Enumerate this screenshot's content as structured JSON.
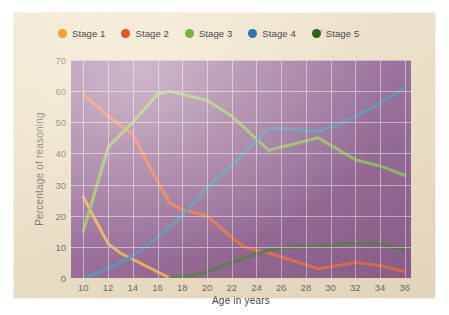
{
  "figure": {
    "paper_color": "#e9dcc2",
    "plot_background": "#7a3f8a",
    "grid_color": "#cbb8d8"
  },
  "legend": {
    "position": "top",
    "items": [
      {
        "label": "Stage 1",
        "color": "#efa52a",
        "icon": "legend-dot-icon"
      },
      {
        "label": "Stage 2",
        "color": "#e8511f",
        "icon": "legend-dot-icon"
      },
      {
        "label": "Stage 3",
        "color": "#7cb338",
        "icon": "legend-dot-icon"
      },
      {
        "label": "Stage 4",
        "color": "#2a77b5",
        "icon": "legend-dot-icon"
      },
      {
        "label": "Stage 5",
        "color": "#2f6326",
        "icon": "legend-dot-icon"
      }
    ]
  },
  "chart_data": {
    "type": "line",
    "title": "",
    "xlabel": "Age in years",
    "ylabel": "Percentage of reasoning",
    "xlim": [
      9,
      36.5
    ],
    "ylim": [
      0,
      70
    ],
    "xticks": [
      10,
      12,
      14,
      16,
      18,
      20,
      22,
      24,
      26,
      28,
      30,
      32,
      34,
      36
    ],
    "yticks": [
      0,
      10,
      20,
      30,
      40,
      50,
      60,
      70
    ],
    "grid": true,
    "legend_position": "top",
    "series": [
      {
        "name": "Stage 1",
        "color": "#efa52a",
        "x": [
          10,
          12,
          13,
          14,
          16,
          17
        ],
        "values": [
          26,
          11,
          8,
          6,
          2,
          0
        ]
      },
      {
        "name": "Stage 2",
        "color": "#e8511f",
        "x": [
          10,
          12,
          14,
          16,
          17,
          18,
          20,
          22,
          23,
          25,
          29,
          32,
          34,
          36
        ],
        "values": [
          59,
          52,
          46,
          31,
          24,
          22,
          20,
          13,
          10,
          8,
          3,
          5,
          4,
          2
        ]
      },
      {
        "name": "Stage 3",
        "color": "#7cb338",
        "x": [
          10,
          12,
          14,
          16,
          17,
          20,
          22,
          25,
          29,
          32,
          34,
          36
        ],
        "values": [
          15,
          42,
          50,
          59,
          60,
          57,
          52,
          41,
          45,
          38,
          36,
          33
        ]
      },
      {
        "name": "Stage 4",
        "color": "#2a77b5",
        "x": [
          10,
          12,
          14,
          16,
          18,
          20,
          22,
          25,
          26,
          29,
          31,
          33,
          36
        ],
        "values": [
          0,
          3,
          7,
          13,
          20,
          29,
          36,
          48,
          48,
          47,
          50,
          54,
          61
        ]
      },
      {
        "name": "Stage 5",
        "color": "#2f6326",
        "x": [
          17,
          19,
          20,
          22,
          25,
          27,
          29,
          31,
          33,
          34,
          36
        ],
        "values": [
          0,
          1,
          2,
          5,
          9,
          10,
          10,
          11,
          11,
          11,
          9
        ]
      }
    ]
  }
}
